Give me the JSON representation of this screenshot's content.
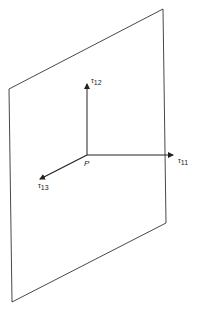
{
  "diagram": {
    "type": "stress-component-plane",
    "plane": {
      "corners": [
        [
          9,
          89
        ],
        [
          163,
          9
        ],
        [
          166,
          223
        ],
        [
          12,
          302
        ]
      ],
      "stroke": "#333333"
    },
    "origin": {
      "label": "P",
      "x": 87,
      "y": 155
    },
    "vectors": [
      {
        "name": "tau-12",
        "symbol": "τ",
        "subscript": "12",
        "from": [
          87,
          155
        ],
        "to": [
          87,
          84
        ]
      },
      {
        "name": "tau-11",
        "symbol": "τ",
        "subscript": "11",
        "from": [
          87,
          155
        ],
        "to": [
          173,
          155
        ]
      },
      {
        "name": "tau-13",
        "symbol": "τ",
        "subscript": "13",
        "from": [
          87,
          155
        ],
        "to": [
          40,
          179
        ]
      }
    ],
    "labels": {
      "tau12": {
        "symbol": "τ",
        "sub": "12"
      },
      "tau11": {
        "symbol": "τ",
        "sub": "11"
      },
      "tau13": {
        "symbol": "τ",
        "sub": "13"
      },
      "point": "P"
    }
  }
}
